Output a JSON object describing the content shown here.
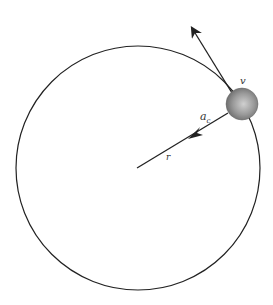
{
  "diagram": {
    "type": "uniform-circular-motion",
    "labels": {
      "velocity": "v",
      "centripetal_acceleration": "a",
      "centripetal_subscript": "c",
      "radius": "r"
    },
    "colors": {
      "background": "#ffffff",
      "stroke": "#222222",
      "ball_light": "#c8c8c8",
      "ball_dark": "#7a7a7a"
    }
  }
}
